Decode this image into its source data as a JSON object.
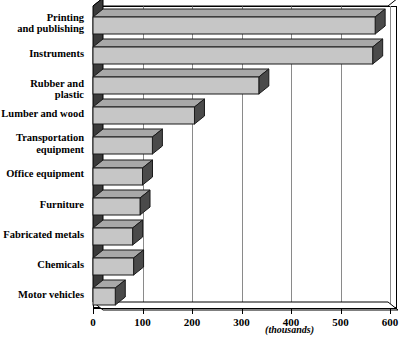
{
  "chart_data": {
    "type": "bar",
    "orientation": "horizontal",
    "style": "3d",
    "title": "",
    "subtitle": "",
    "xlabel": "(thousands)",
    "ylabel": "",
    "xlim": [
      0,
      600
    ],
    "xticks": [
      0,
      100,
      200,
      300,
      400,
      500,
      600
    ],
    "xtick_labels": [
      "0",
      "100",
      "200",
      "300",
      "400",
      "500",
      "600"
    ],
    "grid": true,
    "grid_axis": "x",
    "legend": false,
    "categories": [
      "Printing\nand publishing",
      "Instruments",
      "Rubber and plastic",
      "Lumber and wood",
      "Transportation\nequipment",
      "Office equipment",
      "Furniture",
      "Fabricated metals",
      "Chemicals",
      "Motor vehicles"
    ],
    "values": [
      570,
      565,
      335,
      205,
      120,
      100,
      95,
      80,
      82,
      45
    ],
    "bar_face_color": "#c6c6c6",
    "bar_edge_color": "#1a1a1a",
    "bar_side_color": "#4a4a4a",
    "bar_top_color": "#a8a8a8",
    "wall_color": "#3a3a3a",
    "background_color": "#ffffff"
  },
  "axis": {
    "unit_note": "(thousands)"
  }
}
